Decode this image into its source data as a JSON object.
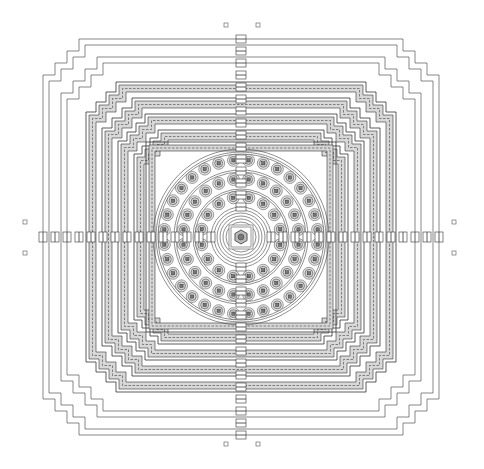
{
  "figure": {
    "type": "architectural-plan",
    "width": 484,
    "height": 469,
    "center": [
      241,
      237
    ],
    "colors": {
      "background": "#ffffff",
      "line": "#333333",
      "gallery_fill": "#d8d8d8",
      "stupa_fill": "#cfcfcf"
    }
  },
  "outer_enclosure": {
    "lines": [
      {
        "half": 198,
        "step": 12
      },
      {
        "half": 192,
        "step": 12
      },
      {
        "half": 180,
        "step": 12
      },
      {
        "half": 174,
        "step": 12
      }
    ]
  },
  "square_terraces": [
    {
      "half": 152,
      "step": 10,
      "gallery_width": 7
    },
    {
      "half": 136,
      "step": 10,
      "gallery_width": 7
    },
    {
      "half": 120,
      "step": 9,
      "gallery_width": 7
    },
    {
      "half": 104,
      "step": 8,
      "gallery_width": 7
    },
    {
      "half": 92,
      "step": 0,
      "gallery_width": 6
    }
  ],
  "circular_terraces": {
    "platform_radius": 88,
    "rings": [
      {
        "radius": 77,
        "stupa_count": 32,
        "ring_radius": 85
      },
      {
        "radius": 58,
        "stupa_count": 24,
        "ring_radius": 67
      },
      {
        "radius": 40,
        "stupa_count": 16,
        "ring_radius": 48
      }
    ],
    "central_rings": [
      30,
      27,
      24,
      21,
      18,
      15
    ],
    "main_stupa_size": 12
  },
  "stairways": [
    "north",
    "south",
    "east",
    "west"
  ],
  "corner_markers": [
    [
      226,
      25
    ],
    [
      258,
      25
    ],
    [
      226,
      444
    ],
    [
      258,
      444
    ],
    [
      25,
      222
    ],
    [
      25,
      253
    ],
    [
      454,
      222
    ],
    [
      454,
      253
    ]
  ]
}
